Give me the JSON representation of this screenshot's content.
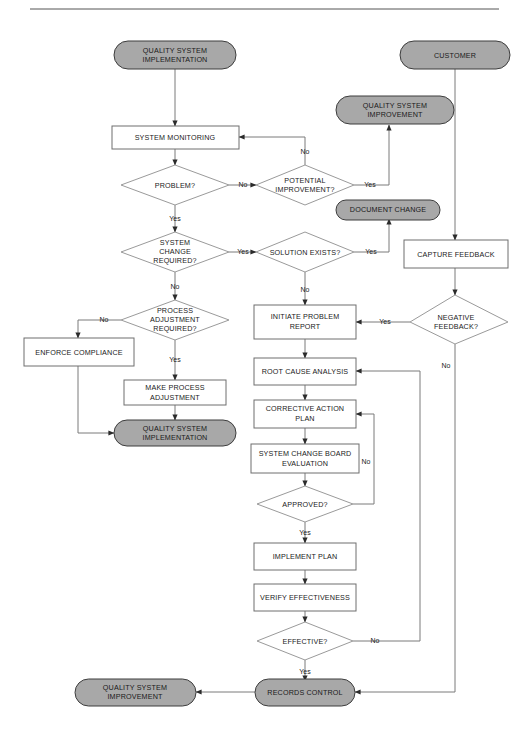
{
  "page": {
    "width": 529,
    "height": 738,
    "background": "#ffffff",
    "header_text": "",
    "colors": {
      "terminator_fill": "#a8a8a8",
      "process_fill": "#ffffff",
      "decision_fill": "#ffffff",
      "border": "#6e6e6e",
      "connector": "#7a7a7a",
      "text": "#1a1a1a"
    }
  },
  "diagram": {
    "type": "flowchart",
    "nodes": [
      {
        "id": "qsi_top",
        "shape": "terminator",
        "label_line1": "QUALITY SYSTEM",
        "label_line2": "IMPLEMENTATION"
      },
      {
        "id": "customer",
        "shape": "terminator",
        "label_line1": "CUSTOMER",
        "label_line2": ""
      },
      {
        "id": "qs_improve_1",
        "shape": "terminator",
        "label_line1": "QUALITY SYSTEM",
        "label_line2": "IMPROVEMENT"
      },
      {
        "id": "sys_mon",
        "shape": "process",
        "label_line1": "SYSTEM MONITORING",
        "label_line2": ""
      },
      {
        "id": "problem",
        "shape": "decision",
        "label_line1": "PROBLEM?",
        "label_line2": "",
        "label_line3": ""
      },
      {
        "id": "pot_improve",
        "shape": "decision",
        "label_line1": "POTENTIAL",
        "label_line2": "IMPROVEMENT?",
        "label_line3": ""
      },
      {
        "id": "doc_change",
        "shape": "terminator",
        "label_line1": "DOCUMENT CHANGE",
        "label_line2": ""
      },
      {
        "id": "sys_change",
        "shape": "decision",
        "label_line1": "SYSTEM",
        "label_line2": "CHANGE",
        "label_line3": "REQUIRED?"
      },
      {
        "id": "sol_exists",
        "shape": "decision",
        "label_line1": "SOLUTION EXISTS?",
        "label_line2": "",
        "label_line3": ""
      },
      {
        "id": "cap_feedback",
        "shape": "process",
        "label_line1": "CAPTURE FEEDBACK",
        "label_line2": ""
      },
      {
        "id": "proc_adj",
        "shape": "decision",
        "label_line1": "PROCESS",
        "label_line2": "ADJUSTMENT",
        "label_line3": "REQUIRED?"
      },
      {
        "id": "init_prob",
        "shape": "process",
        "label_line1": "INITIATE PROBLEM",
        "label_line2": "REPORT"
      },
      {
        "id": "neg_feedback",
        "shape": "decision",
        "label_line1": "NEGATIVE",
        "label_line2": "FEEDBACK?",
        "label_line3": ""
      },
      {
        "id": "enforce",
        "shape": "process",
        "label_line1": "ENFORCE COMPLIANCE",
        "label_line2": ""
      },
      {
        "id": "root_cause",
        "shape": "process",
        "label_line1": "ROOT CAUSE ANALYSIS",
        "label_line2": ""
      },
      {
        "id": "corr_action",
        "shape": "process",
        "label_line1": "CORRECTIVE ACTION",
        "label_line2": "PLAN"
      },
      {
        "id": "make_proc",
        "shape": "process",
        "label_line1": "MAKE PROCESS",
        "label_line2": "ADJUSTMENT"
      },
      {
        "id": "scb_eval",
        "shape": "process",
        "label_line1": "SYSTEM CHANGE BOARD",
        "label_line2": "EVALUATION"
      },
      {
        "id": "qsi_bottom",
        "shape": "terminator",
        "label_line1": "QUALITY SYSTEM",
        "label_line2": "IMPLEMENTATION"
      },
      {
        "id": "approved",
        "shape": "decision",
        "label_line1": "APPROVED?",
        "label_line2": "",
        "label_line3": ""
      },
      {
        "id": "impl_plan",
        "shape": "process",
        "label_line1": "IMPLEMENT PLAN",
        "label_line2": ""
      },
      {
        "id": "verify_eff",
        "shape": "process",
        "label_line1": "VERIFY EFFECTIVENESS",
        "label_line2": ""
      },
      {
        "id": "effective",
        "shape": "decision",
        "label_line1": "EFFECTIVE?",
        "label_line2": "",
        "label_line3": ""
      },
      {
        "id": "qs_improve_2",
        "shape": "terminator",
        "label_line1": "QUALITY SYSTEM",
        "label_line2": "IMPROVEMENT"
      },
      {
        "id": "records",
        "shape": "terminator",
        "label_line1": "RECORDS CONTROL",
        "label_line2": ""
      }
    ],
    "edge_labels": {
      "problem_no": "No",
      "problem_yes": "Yes",
      "pot_improve_no": "No",
      "pot_improve_yes": "Yes",
      "sys_change_yes": "Yes",
      "sys_change_no": "No",
      "sol_exists_yes": "Yes",
      "sol_exists_no": "No",
      "proc_adj_no": "No",
      "proc_adj_yes": "Yes",
      "neg_feedback_yes": "Yes",
      "neg_feedback_no": "No",
      "approved_no": "No",
      "approved_yes": "Yes",
      "effective_no": "No",
      "effective_yes": "Yes"
    }
  }
}
